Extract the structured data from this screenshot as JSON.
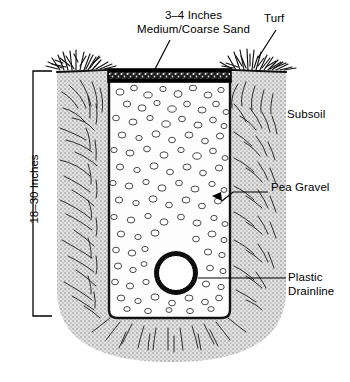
{
  "diagram": {
    "labels": {
      "sand_line1": "3–4 Inches",
      "sand_line2": "Medium/Coarse Sand",
      "turf": "Turf",
      "subsoil": "Subsoil",
      "pea_gravel": "Pea Gravel",
      "drainline_line1": "Plastic",
      "drainline_line2": "Drainline",
      "depth": "18–30 Inches"
    },
    "colors": {
      "ink": "#000000",
      "subsoil_fill": "#d4d4d4",
      "gravel_fill": "#ffffff",
      "sand_band": "#2b2b2b",
      "background": "#ffffff"
    },
    "geometry": {
      "soil_left": 57,
      "soil_right": 286,
      "soil_top": 72,
      "soil_bottom": 362,
      "trench_left": 108,
      "trench_right": 231,
      "trench_top": 72,
      "trench_bottom": 318,
      "sand_band_top": 70,
      "sand_band_height": 13,
      "pipe_cx": 176,
      "pipe_cy": 273,
      "pipe_r_outer": 22,
      "pipe_r_inner": 17,
      "bracket_x": 33,
      "bracket_top": 71,
      "bracket_bottom": 316
    }
  }
}
